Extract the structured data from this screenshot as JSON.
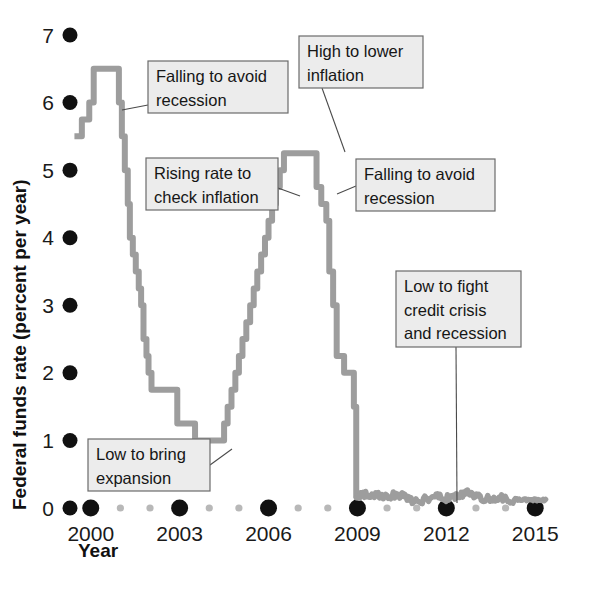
{
  "chart_data": {
    "type": "line",
    "title": "",
    "xlabel": "Year",
    "ylabel": "Federal funds rate (percent per year)",
    "xlim": [
      1999.3,
      2015.6
    ],
    "ylim": [
      0,
      7
    ],
    "grid": false,
    "legend": null,
    "xticks": [
      "2000",
      "2003",
      "2006",
      "2009",
      "2012",
      "2015"
    ],
    "xtick_values": [
      2000,
      2003,
      2006,
      2009,
      2012,
      2015
    ],
    "xminor_values": [
      2001,
      2002,
      2004,
      2005,
      2007,
      2008,
      2010,
      2011,
      2013,
      2014
    ],
    "yticks": [
      "0",
      "1",
      "2",
      "3",
      "4",
      "5",
      "6",
      "7"
    ],
    "ytick_values": [
      0,
      1,
      2,
      3,
      4,
      5,
      6,
      7
    ],
    "series_name": "Federal funds rate",
    "series_color": "#9d9d9d",
    "marker_color": "#111111",
    "minor_marker_color": "#b8b8b8",
    "x": [
      1999.45,
      1999.7,
      1999.95,
      2000.1,
      2000.38,
      2000.95,
      2001.05,
      2001.15,
      2001.25,
      2001.32,
      2001.42,
      2001.52,
      2001.62,
      2001.7,
      2001.78,
      2001.88,
      2001.95,
      2002.05,
      2002.25,
      2002.5,
      2002.7,
      2002.92,
      2003.1,
      2003.35,
      2003.52,
      2003.8,
      2004.1,
      2004.5,
      2004.62,
      2004.75,
      2004.88,
      2005.0,
      2005.12,
      2005.25,
      2005.38,
      2005.5,
      2005.62,
      2005.75,
      2005.88,
      2006.0,
      2006.12,
      2006.25,
      2006.38,
      2006.52,
      2007.42,
      2007.62,
      2007.78,
      2007.95,
      2008.05,
      2008.18,
      2008.3,
      2008.55,
      2008.78,
      2008.88,
      2008.96
    ],
    "y": [
      5.5,
      5.75,
      6.0,
      6.5,
      6.5,
      6.0,
      5.5,
      5.0,
      4.5,
      4.0,
      3.75,
      3.5,
      3.25,
      3.0,
      2.5,
      2.25,
      2.0,
      1.75,
      1.75,
      1.75,
      1.75,
      1.25,
      1.25,
      1.25,
      1.0,
      1.0,
      1.0,
      1.25,
      1.5,
      1.75,
      2.0,
      2.25,
      2.5,
      2.75,
      3.0,
      3.25,
      3.5,
      3.75,
      4.0,
      4.25,
      4.5,
      4.75,
      5.0,
      5.25,
      5.25,
      4.75,
      4.5,
      4.25,
      3.5,
      3.0,
      2.25,
      2.0,
      2.0,
      1.5,
      0.15
    ],
    "post2009_mean": 0.16,
    "post2009_range": [
      0.05,
      0.3
    ],
    "annotations": [
      {
        "id": "falling-to-avoid-recession-2001",
        "lines": [
          "Falling to avoid",
          "recession"
        ],
        "box": {
          "x": 148,
          "y": 61,
          "w": 140,
          "h": 52
        },
        "leader": [
          [
            148,
            105
          ],
          [
            122,
            110
          ]
        ]
      },
      {
        "id": "rising-rate-to-check-inflation",
        "lines": [
          "Rising rate to",
          "check inflation"
        ],
        "box": {
          "x": 146,
          "y": 158,
          "w": 132,
          "h": 52
        },
        "leader": [
          [
            278,
            188
          ],
          [
            300,
            196
          ]
        ]
      },
      {
        "id": "high-to-lower-inflation",
        "lines": [
          "High to lower",
          "inflation"
        ],
        "box": {
          "x": 299,
          "y": 36,
          "w": 124,
          "h": 52
        },
        "leader": [
          [
            322,
            88
          ],
          [
            345,
            152
          ]
        ]
      },
      {
        "id": "falling-to-avoid-recession-2007",
        "lines": [
          "Falling to avoid",
          "recession"
        ],
        "box": {
          "x": 356,
          "y": 159,
          "w": 139,
          "h": 52
        },
        "leader": [
          [
            356,
            186
          ],
          [
            337,
            194
          ]
        ]
      },
      {
        "id": "low-to-fight-credit-crisis-and-recession",
        "lines": [
          "Low to fight",
          "credit crisis",
          "and recession"
        ],
        "box": {
          "x": 396,
          "y": 271,
          "w": 125,
          "h": 76
        },
        "leader": [
          [
            456,
            347
          ],
          [
            457,
            503
          ]
        ]
      },
      {
        "id": "low-to-bring-expansion",
        "lines": [
          "Low to bring",
          "expansion"
        ],
        "box": {
          "x": 88,
          "y": 439,
          "w": 122,
          "h": 52
        },
        "leader": [
          [
            210,
            465
          ],
          [
            232,
            449
          ]
        ]
      }
    ]
  },
  "axes": {
    "x_axis_title": "Year",
    "y_axis_title": "Federal funds rate (percent per year)"
  }
}
